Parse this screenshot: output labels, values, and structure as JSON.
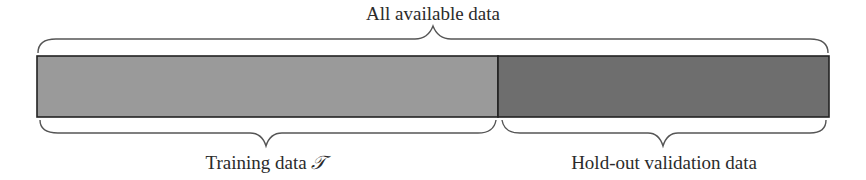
{
  "diagram": {
    "top_label": "All available data",
    "segments": [
      {
        "label": "Training data",
        "symbol": "𝒯",
        "color": "#9a9a9a",
        "x_start": 37,
        "x_end": 498
      },
      {
        "label": "Hold-out validation data",
        "color": "#6e6e6e",
        "x_start": 498,
        "x_end": 829
      }
    ],
    "border_color": "#222222",
    "brace_color": "#555555"
  }
}
